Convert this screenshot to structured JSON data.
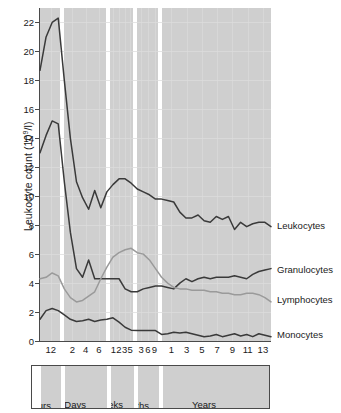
{
  "chart_data": {
    "type": "line",
    "title": "",
    "xlabel": "",
    "ylabel": "Leukocyte count (10⁹/l)",
    "ylabel_prefix": "Leukocyte count (10",
    "ylabel_exp": "9",
    "ylabel_suffix": "/l)",
    "ylim": [
      0,
      23
    ],
    "yticks": [
      0,
      2,
      4,
      6,
      8,
      10,
      12,
      14,
      16,
      18,
      20,
      22
    ],
    "grid": true,
    "legend_position": "right-inline",
    "x_axis_description": "Age from birth: hours, days, weeks, months then years (non-linear segmented scale)",
    "panels": [
      {
        "name": "Hours",
        "ticks": [
          "12"
        ],
        "start_pct": 0.0,
        "end_pct": 8.7
      },
      {
        "name": "Days",
        "ticks": [
          "2",
          "4",
          "6"
        ],
        "start_pct": 10.4,
        "end_pct": 28.6
      },
      {
        "name": "Weeks",
        "ticks": [
          "1",
          "2",
          "3",
          "5"
        ],
        "start_pct": 30.3,
        "end_pct": 40.3
      },
      {
        "name": "Months",
        "ticks": [
          "3",
          "6",
          "9"
        ],
        "start_pct": 42.0,
        "end_pct": 51.1
      },
      {
        "name": "Years",
        "ticks": [
          "1",
          "3",
          "5",
          "7",
          "9",
          "11",
          "13"
        ],
        "start_pct": 52.8,
        "end_pct": 100.0
      }
    ],
    "xtick_labels": [
      "12",
      "2",
      "4",
      "6",
      "1",
      "2",
      "3",
      "5",
      "3",
      "6",
      "9",
      "1",
      "3",
      "5",
      "7",
      "9",
      "11",
      "13"
    ],
    "series": [
      {
        "name": "Leukocytes",
        "color": "#3a3a3a",
        "label_y": 8.0,
        "values": [
          18.7,
          21.0,
          22.0,
          22.3,
          18.0,
          14.0,
          11.0,
          9.9,
          9.1,
          10.4,
          9.2,
          10.3,
          10.8,
          11.2,
          11.2,
          10.9,
          10.5,
          10.3,
          10.1,
          9.8,
          9.8,
          9.7,
          9.6,
          8.9,
          8.5,
          8.5,
          8.7,
          8.3,
          8.2,
          8.6,
          8.4,
          8.6,
          7.7,
          8.2,
          7.9,
          8.1,
          8.2,
          8.2,
          7.9
        ]
      },
      {
        "name": "Granulocytes",
        "color": "#3a3a3a",
        "label_y": 5.0,
        "values": [
          13.0,
          14.2,
          15.2,
          15.0,
          11.0,
          7.5,
          5.0,
          4.4,
          5.6,
          4.3,
          4.3,
          4.3,
          4.3,
          4.3,
          3.6,
          3.4,
          3.4,
          3.6,
          3.7,
          3.8,
          3.8,
          3.7,
          3.6,
          4.0,
          4.3,
          4.1,
          4.3,
          4.4,
          4.3,
          4.4,
          4.4,
          4.4,
          4.5,
          4.4,
          4.3,
          4.6,
          4.8,
          4.9,
          5.0
        ]
      },
      {
        "name": "Lymphocytes",
        "color": "#9a9a9a",
        "label_y": 2.9,
        "values": [
          4.3,
          4.4,
          4.7,
          4.5,
          3.6,
          3.0,
          2.7,
          2.8,
          3.1,
          3.4,
          4.3,
          5.1,
          5.8,
          6.1,
          6.3,
          6.4,
          6.1,
          6.0,
          5.6,
          5.0,
          4.4,
          4.0,
          3.7,
          3.6,
          3.6,
          3.5,
          3.5,
          3.5,
          3.4,
          3.4,
          3.3,
          3.3,
          3.2,
          3.2,
          3.3,
          3.3,
          3.2,
          3.0,
          2.7
        ]
      },
      {
        "name": "Monocytes",
        "color": "#3a3a3a",
        "label_y": 0.45,
        "values": [
          1.5,
          2.1,
          2.25,
          2.1,
          1.8,
          1.5,
          1.35,
          1.4,
          1.5,
          1.35,
          1.45,
          1.5,
          1.6,
          1.3,
          0.95,
          0.75,
          0.72,
          0.72,
          0.72,
          0.72,
          0.45,
          0.5,
          0.6,
          0.55,
          0.6,
          0.5,
          0.4,
          0.3,
          0.35,
          0.45,
          0.3,
          0.4,
          0.5,
          0.35,
          0.45,
          0.3,
          0.5,
          0.4,
          0.3
        ]
      }
    ]
  },
  "legend": {
    "items": [
      {
        "label": "Leukocytes"
      },
      {
        "label": "Granulocytes"
      },
      {
        "label": "Lymphocytes"
      },
      {
        "label": "Monocytes"
      }
    ]
  },
  "period_bar": {
    "items": [
      {
        "label": "Hours"
      },
      {
        "label": "Days"
      },
      {
        "label": "Weeks"
      },
      {
        "label": "Months"
      },
      {
        "label": "Years"
      }
    ]
  }
}
